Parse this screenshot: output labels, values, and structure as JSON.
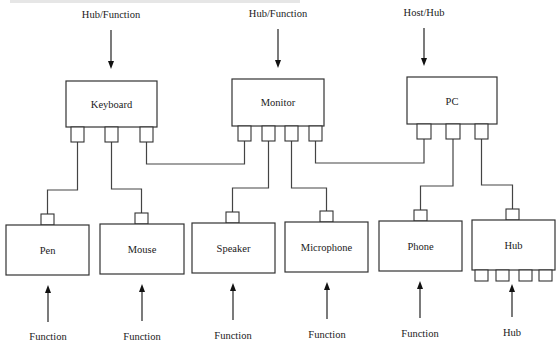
{
  "header": {
    "cropped_caption": "…"
  },
  "colors": {
    "stroke": "#333333",
    "text": "#1a1a1a",
    "background": "#ffffff"
  },
  "top_devices": [
    {
      "id": "keyboard",
      "label": "Keyboard",
      "role": "Hub/Function",
      "x": 66,
      "y": 81,
      "w": 91,
      "h": 46,
      "ports": [
        71,
        105,
        139
      ],
      "port_y": 127,
      "arrow_x": 111
    },
    {
      "id": "monitor",
      "label": "Monitor",
      "role": "Hub/Function",
      "x": 232,
      "y": 79,
      "w": 92,
      "h": 47,
      "ports": [
        238,
        262,
        285,
        309
      ],
      "port_y": 126,
      "arrow_x": 278
    },
    {
      "id": "pc",
      "label": "PC",
      "role": "Host/Hub",
      "x": 407,
      "y": 77,
      "w": 90,
      "h": 47,
      "ports": [
        417,
        446,
        475
      ],
      "port_y": 124,
      "arrow_x": 424
    }
  ],
  "bottom_devices": [
    {
      "id": "pen",
      "label": "Pen",
      "role": "Function",
      "x": 6,
      "y": 225,
      "w": 83,
      "h": 50,
      "port_x": 41,
      "arrow_x": 48
    },
    {
      "id": "mouse",
      "label": "Mouse",
      "role": "Function",
      "x": 100,
      "y": 224,
      "w": 84,
      "h": 50,
      "port_x": 135,
      "arrow_x": 142
    },
    {
      "id": "speaker",
      "label": "Speaker",
      "role": "Function",
      "x": 192,
      "y": 223,
      "w": 83,
      "h": 50,
      "port_x": 226,
      "arrow_x": 233
    },
    {
      "id": "microphone",
      "label": "Microphone",
      "role": "Function",
      "x": 285,
      "y": 222,
      "w": 83,
      "h": 50,
      "port_x": 320,
      "arrow_x": 327
    },
    {
      "id": "phone",
      "label": "Phone",
      "role": "Function",
      "x": 379,
      "y": 221,
      "w": 83,
      "h": 50,
      "port_x": 414,
      "arrow_x": 420
    },
    {
      "id": "hub",
      "label": "Hub",
      "role": "Hub",
      "x": 472,
      "y": 220,
      "w": 83,
      "h": 50,
      "port_x": 506,
      "arrow_x": 512,
      "downstream_ports": [
        475,
        496,
        519,
        539
      ]
    }
  ],
  "connections": [
    {
      "from": "keyboard.port1",
      "to": "pen"
    },
    {
      "from": "keyboard.port2",
      "to": "mouse"
    },
    {
      "from": "keyboard.port3",
      "to": "monitor.port1"
    },
    {
      "from": "monitor.port2",
      "to": "speaker"
    },
    {
      "from": "monitor.port3",
      "to": "microphone"
    },
    {
      "from": "monitor.port4",
      "to": "pc.port1"
    },
    {
      "from": "pc.port2",
      "to": "phone"
    },
    {
      "from": "pc.port3",
      "to": "hub"
    }
  ]
}
